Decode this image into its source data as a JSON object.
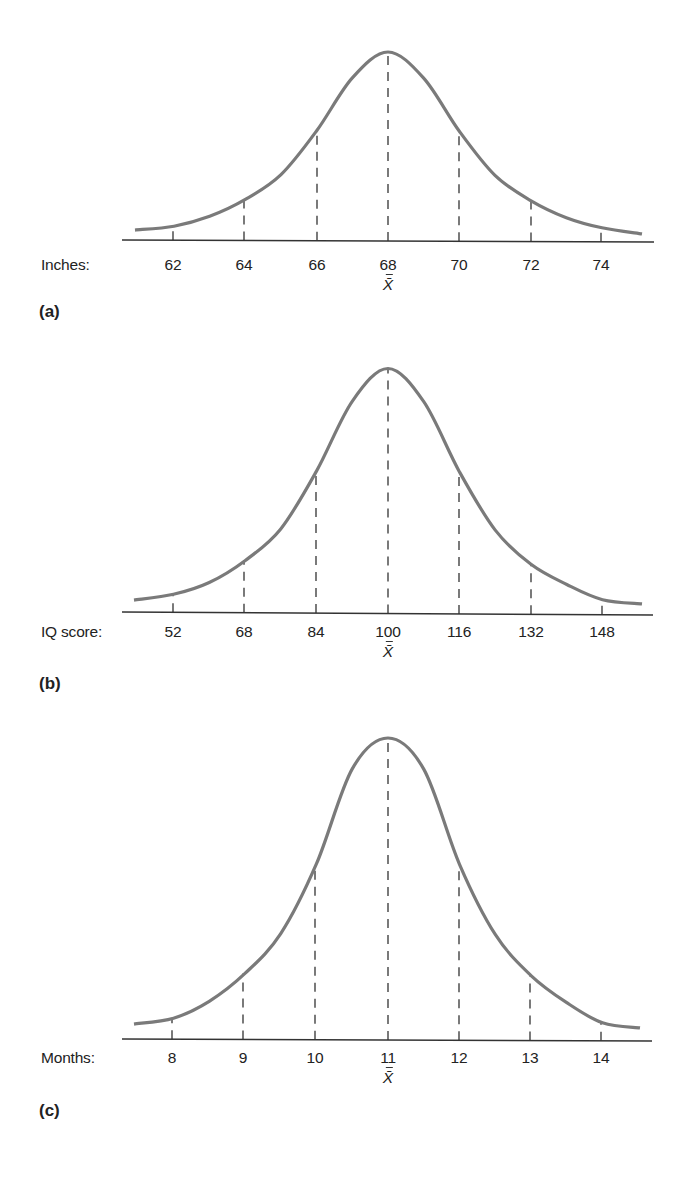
{
  "colors": {
    "curve": "#7a7a7a",
    "axis": "#333333",
    "dash": "#333333",
    "text": "#222222"
  },
  "chart_data": [
    {
      "type": "line",
      "panel_label": "(a)",
      "title": "",
      "xlabel": "Inches:",
      "mean_label": "X̄",
      "mean_value": 68,
      "sd": 2,
      "categories": [
        "62",
        "64",
        "66",
        "68",
        "70",
        "72",
        "74"
      ],
      "x": [
        62,
        64,
        66,
        68,
        70,
        72,
        74
      ],
      "curve": "normal distribution",
      "dashed_lines_at": [
        62,
        64,
        66,
        68,
        70,
        72,
        74
      ],
      "grid": false,
      "legend": null,
      "layout": {
        "top": 0,
        "baseline_y": 240,
        "axis_tilt": 2,
        "axis_x_start": 122,
        "axis_x_end": 654,
        "tick_x": [
          173,
          244,
          317,
          388,
          459,
          531,
          601
        ],
        "curve_x_start": 135,
        "curve_x_end": 642,
        "profile_z": [
          -3.55,
          -3,
          -2.5,
          -2,
          -1.5,
          -1,
          -0.5,
          0,
          0.5,
          1,
          1.5,
          2,
          2.5,
          3,
          3.55
        ],
        "profile_h": [
          10,
          14,
          24,
          41,
          66,
          110,
          163,
          189,
          163,
          110,
          66,
          41,
          24,
          14,
          8
        ],
        "axis_name_x": 41,
        "axis_name_y": 256,
        "tick_label_y": 256,
        "mean_label_y": 274,
        "panel_label_x": 39,
        "panel_label_y": 302
      }
    },
    {
      "type": "line",
      "panel_label": "(b)",
      "title": "",
      "xlabel": "IQ score:",
      "mean_label": "X̄",
      "mean_value": 100,
      "sd": 16,
      "categories": [
        "52",
        "68",
        "84",
        "100",
        "116",
        "132",
        "148"
      ],
      "x": [
        52,
        68,
        84,
        100,
        116,
        132,
        148
      ],
      "curve": "normal distribution",
      "dashed_lines_at": [
        52,
        68,
        84,
        100,
        116,
        132,
        148
      ],
      "grid": false,
      "legend": null,
      "layout": {
        "top": 0,
        "baseline_y": 612,
        "axis_tilt": 3,
        "axis_x_start": 122,
        "axis_x_end": 653,
        "tick_x": [
          173,
          244,
          316,
          388,
          459,
          531,
          602
        ],
        "curve_x_start": 134,
        "curve_x_end": 642,
        "profile_z": [
          -3.55,
          -3,
          -2.5,
          -2,
          -1.5,
          -1,
          -0.5,
          0,
          0.5,
          1,
          1.5,
          2,
          2.5,
          3,
          3.55
        ],
        "profile_h": [
          12,
          18,
          30,
          52,
          84,
          142,
          212,
          245,
          212,
          142,
          84,
          50,
          30,
          15,
          11
        ],
        "axis_name_x": 41,
        "axis_name_y": 623,
        "tick_label_y": 623,
        "mean_label_y": 641,
        "panel_label_x": 39,
        "panel_label_y": 674
      }
    },
    {
      "type": "line",
      "panel_label": "(c)",
      "title": "",
      "xlabel": "Months:",
      "mean_label": "X̄",
      "mean_value": 11,
      "sd": 1,
      "categories": [
        "8",
        "9",
        "10",
        "11",
        "12",
        "13",
        "14"
      ],
      "x": [
        8,
        9,
        10,
        11,
        12,
        13,
        14
      ],
      "curve": "normal distribution",
      "dashed_lines_at": [
        8,
        9,
        10,
        11,
        12,
        13,
        14
      ],
      "grid": false,
      "legend": null,
      "layout": {
        "top": 0,
        "baseline_y": 1039,
        "axis_tilt": 2,
        "axis_x_start": 122,
        "axis_x_end": 652,
        "tick_x": [
          172,
          243,
          315,
          388,
          459,
          530,
          601
        ],
        "curve_x_start": 134,
        "curve_x_end": 640,
        "profile_z": [
          -3.55,
          -3,
          -2.5,
          -2,
          -1.5,
          -1,
          -0.5,
          0,
          0.5,
          1,
          1.5,
          2,
          2.5,
          3,
          3.55
        ],
        "profile_h": [
          15,
          21,
          38,
          66,
          106,
          176,
          271,
          302,
          271,
          176,
          106,
          65,
          38,
          18,
          13
        ],
        "axis_name_x": 41,
        "axis_name_y": 1049,
        "tick_label_y": 1049,
        "mean_label_y": 1067,
        "panel_label_x": 39,
        "panel_label_y": 1101
      }
    }
  ]
}
